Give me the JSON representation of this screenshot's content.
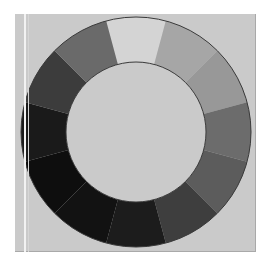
{
  "figure": {
    "type": "grayscale-value-wheel",
    "segment_count": 12,
    "background": "#ffffff",
    "panel_color": "#cacaca",
    "outline_color": "#3a3a3a",
    "inner_fill": "#cacaca",
    "segments": [
      {
        "position": "top",
        "color": "#d4d4d4"
      },
      {
        "position": "top-right-1",
        "color": "#a6a6a6"
      },
      {
        "position": "top-right-2",
        "color": "#989898"
      },
      {
        "position": "right-upper",
        "color": "#6c6c6c"
      },
      {
        "position": "right-lower",
        "color": "#5c5c5c"
      },
      {
        "position": "bottom-right-1",
        "color": "#3e3e3e"
      },
      {
        "position": "bottom-right-2",
        "color": "#1c1c1c"
      },
      {
        "position": "bottom",
        "color": "#121212"
      },
      {
        "position": "bottom-left-1",
        "color": "#0e0e0e"
      },
      {
        "position": "left-lower",
        "color": "#1a1a1a"
      },
      {
        "position": "left-upper",
        "color": "#3c3c3c"
      },
      {
        "position": "top-left",
        "color": "#6a6a6a"
      }
    ]
  }
}
